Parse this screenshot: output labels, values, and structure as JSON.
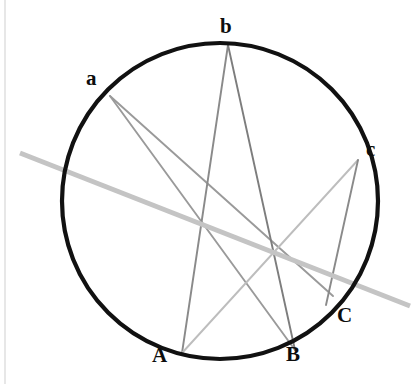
{
  "figure": {
    "canvas": {
      "width": 416,
      "height": 384,
      "background": "#ffffff"
    },
    "left_margin_rule": {
      "x": 5,
      "y1": 0,
      "y2": 384,
      "color": "#cfcfcf",
      "width": 1
    },
    "circle": {
      "name": "circumscribed-circle",
      "cx": 220,
      "cy": 201,
      "r": 158,
      "stroke": "#111111",
      "stroke_width": 4.2,
      "fill": "none"
    },
    "points": [
      {
        "id": "a",
        "label": "a",
        "x": 110,
        "y": 96,
        "label_x": 86,
        "label_y": 68,
        "label_class": "upper-label"
      },
      {
        "id": "b",
        "label": "b",
        "x": 228,
        "y": 45,
        "label_x": 220,
        "label_y": 16,
        "label_class": "upper-label"
      },
      {
        "id": "c",
        "label": "c",
        "x": 358,
        "y": 160,
        "label_x": 366,
        "label_y": 139,
        "label_class": "upper-label"
      },
      {
        "id": "A",
        "label": "A",
        "x": 182,
        "y": 353,
        "label_x": 152,
        "label_y": 345,
        "label_class": "lower-label"
      },
      {
        "id": "B",
        "label": "B",
        "x": 295,
        "y": 350,
        "label_x": 286,
        "label_y": 344,
        "label_class": "lower-label"
      },
      {
        "id": "C",
        "label": "C",
        "x": 333,
        "y": 296,
        "label_x": 337,
        "label_y": 305,
        "label_class": "lower-label"
      }
    ],
    "chords": [
      {
        "id": "a-B",
        "from": "a",
        "to": "B",
        "x1": 110,
        "y1": 96,
        "x2": 295,
        "y2": 350,
        "stroke": "#9a9a9a",
        "stroke_width": 1.9
      },
      {
        "id": "a-C",
        "from": "a",
        "to": "C",
        "x1": 110,
        "y1": 96,
        "x2": 333,
        "y2": 296,
        "stroke": "#9a9a9a",
        "stroke_width": 1.9
      },
      {
        "id": "b-A",
        "from": "b",
        "to": "A",
        "x1": 228,
        "y1": 45,
        "x2": 182,
        "y2": 353,
        "stroke": "#8a8a8a",
        "stroke_width": 1.9
      },
      {
        "id": "b-B",
        "from": "b",
        "to": "B",
        "x1": 228,
        "y1": 45,
        "x2": 295,
        "y2": 350,
        "stroke": "#7d7d7d",
        "stroke_width": 1.9
      },
      {
        "id": "c-A",
        "from": "c",
        "to": "A",
        "x1": 358,
        "y1": 160,
        "x2": 182,
        "y2": 353,
        "stroke": "#bdbdbd",
        "stroke_width": 1.9
      },
      {
        "id": "c-C",
        "from": "c",
        "to": "C",
        "x1": 358,
        "y1": 160,
        "x2": 326,
        "y2": 305,
        "stroke": "#8a8a8a",
        "stroke_width": 1.9
      }
    ],
    "pascal_line": {
      "id": "pascal-line",
      "x1": 20,
      "y1": 153,
      "x2": 410,
      "y2": 306,
      "stroke": "#c4c4c4",
      "stroke_width": 5.0
    }
  },
  "chart_data": {
    "type": "scatter",
    "xlabel": "",
    "ylabel": "",
    "xlim": [
      0,
      416
    ],
    "ylim": [
      384,
      0
    ],
    "grid": false,
    "legend": null,
    "annotations": [
      "a",
      "b",
      "c",
      "A",
      "B",
      "C"
    ],
    "points": [
      {
        "label": "a",
        "x": 110,
        "y": 96
      },
      {
        "label": "b",
        "x": 228,
        "y": 45
      },
      {
        "label": "c",
        "x": 358,
        "y": 160
      },
      {
        "label": "A",
        "x": 182,
        "y": 353
      },
      {
        "label": "B",
        "x": 295,
        "y": 350
      },
      {
        "label": "C",
        "x": 333,
        "y": 296
      }
    ],
    "series": [
      {
        "name": "circle",
        "type": "circle",
        "cx": 220,
        "cy": 201,
        "r": 158
      },
      {
        "name": "aB",
        "type": "segment",
        "x": [
          110,
          295
        ],
        "y": [
          96,
          350
        ]
      },
      {
        "name": "aC",
        "type": "segment",
        "x": [
          110,
          333
        ],
        "y": [
          96,
          296
        ]
      },
      {
        "name": "bA",
        "type": "segment",
        "x": [
          228,
          182
        ],
        "y": [
          45,
          353
        ]
      },
      {
        "name": "bB",
        "type": "segment",
        "x": [
          228,
          295
        ],
        "y": [
          45,
          350
        ]
      },
      {
        "name": "cA",
        "type": "segment",
        "x": [
          358,
          182
        ],
        "y": [
          160,
          353
        ]
      },
      {
        "name": "cC",
        "type": "segment",
        "x": [
          358,
          326
        ],
        "y": [
          160,
          305
        ]
      },
      {
        "name": "pascal",
        "type": "segment",
        "x": [
          20,
          410
        ],
        "y": [
          153,
          306
        ]
      }
    ]
  }
}
